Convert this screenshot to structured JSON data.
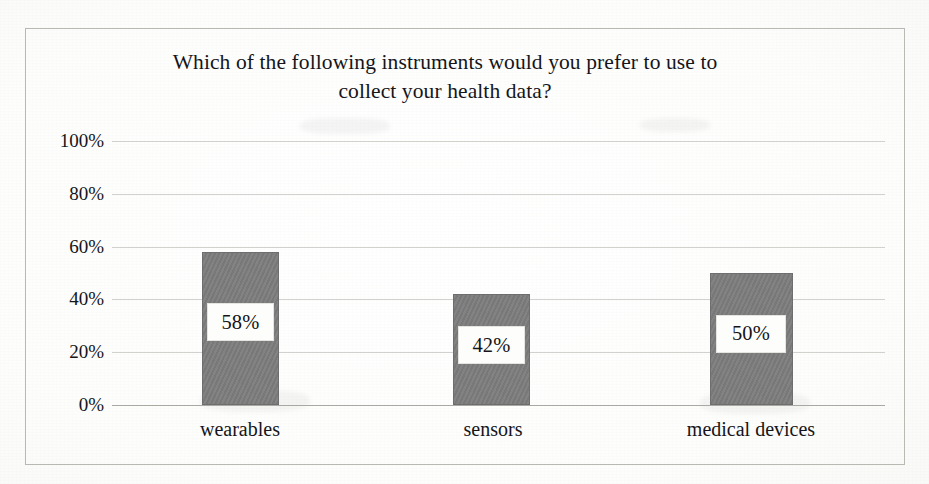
{
  "chart_data": {
    "type": "bar",
    "title": "Which of the following instruments would you prefer to use to\ncollect your health data?",
    "title_line1": "Which of the following instruments would you prefer to use to",
    "title_line2": "collect your health data?",
    "categories": [
      "wearables",
      "sensors",
      "medical devices"
    ],
    "values": [
      58,
      42,
      50
    ],
    "value_labels": [
      "58%",
      "42%",
      "50%"
    ],
    "xlabel": "",
    "ylabel": "",
    "ylim": [
      0,
      100
    ],
    "ytick_values": [
      100,
      80,
      60,
      40,
      20,
      0
    ],
    "ytick_labels": [
      "100%",
      "80%",
      "60%",
      "40%",
      "20%",
      "0%"
    ],
    "grid": true,
    "legend": false,
    "legend_position": "none",
    "bar_color": "#7c7c7c",
    "plot_background": "#ffffff",
    "frame_color": "#b9b9b4",
    "gridline_color": "#c9c9c4",
    "data_label_background": "#fdfdfc",
    "text_color": "#15151a"
  },
  "caption": {
    "stub_text": ""
  }
}
